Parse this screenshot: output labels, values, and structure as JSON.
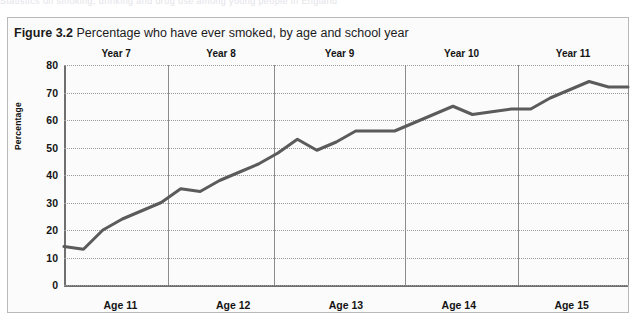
{
  "page": {
    "bleed_text_top": "Statistics on smoking, drinking and drug use among young people in England"
  },
  "figure": {
    "number_label": "Figure 3.2",
    "title_rest": "Percentage who have ever smoked, by age and school year",
    "border_color": "#b9b9b9",
    "background_color": "#fbfbfb"
  },
  "chart_data": {
    "type": "line",
    "title": "Percentage who have ever smoked, by age and school year",
    "xlabel": "",
    "ylabel": "Percentage",
    "ylim": [
      0,
      80
    ],
    "ytick_values": [
      0,
      10,
      20,
      30,
      40,
      50,
      60,
      70,
      80
    ],
    "ytick_labels": [
      "0",
      "10",
      "20",
      "30",
      "40",
      "50",
      "60",
      "70",
      "80"
    ],
    "grid": true,
    "legend": "none",
    "line_color": "#5b5b5b",
    "line_width": 3,
    "age_groups": [
      "Age 11",
      "Age 12",
      "Age 13",
      "Age 14",
      "Age 15"
    ],
    "school_year_bands": [
      "Year 7",
      "Year 8",
      "Year 9",
      "Year 10",
      "Year 11"
    ],
    "band_boundaries_pct": [
      0,
      18.5,
      37.2,
      60.5,
      80.5,
      100
    ],
    "values": [
      14,
      13,
      20,
      24,
      27,
      30,
      35,
      34,
      38,
      41,
      44,
      48,
      53,
      49,
      52,
      56,
      56,
      56,
      59,
      62,
      65,
      62,
      63,
      64,
      64,
      68,
      71,
      74,
      72,
      72
    ]
  }
}
